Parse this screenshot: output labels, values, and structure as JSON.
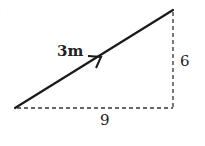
{
  "diagram": {
    "corner_mark": ")",
    "vector": {
      "label": "3m",
      "start": [
        15,
        108
      ],
      "end": [
        173,
        10
      ],
      "color": "#1a1a1a"
    },
    "horizontal_leg": {
      "label": "9",
      "style": "dashed"
    },
    "vertical_leg": {
      "label": "6",
      "style": "dashed"
    }
  }
}
